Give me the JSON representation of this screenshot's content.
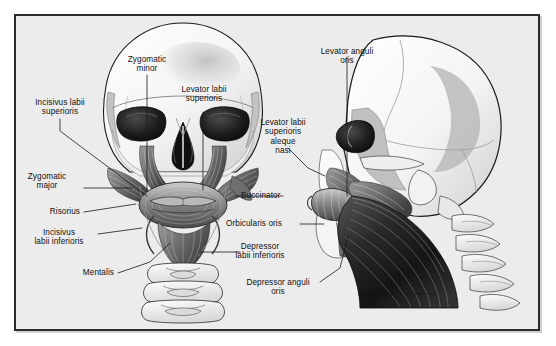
{
  "figure": {
    "background_color": "#ececec",
    "outer_color": "#ffffff",
    "frame_color": "#2b2b2b",
    "text_color": "#111111"
  },
  "views": {
    "anterior": {
      "name": "anterior-skull-view",
      "description": "Front view of skull with facial muscles and cervical vertebrae"
    },
    "lateral": {
      "name": "lateral-skull-view",
      "description": "Side view of skull with platysma and facial muscles"
    }
  },
  "labels": [
    {
      "id": "zygomatic-minor",
      "text": "Zygomatic\nminor",
      "align": "center"
    },
    {
      "id": "levator-labii-superioris",
      "text": "Levator labii\nsuperioris",
      "align": "center"
    },
    {
      "id": "incisivus-labii-superioris",
      "text": "Incisivus labii\nsuperioris",
      "align": "center"
    },
    {
      "id": "zygomatic-major",
      "text": "Zygomatic\nmajor",
      "align": "center"
    },
    {
      "id": "risorius",
      "text": "Risorius",
      "align": "right"
    },
    {
      "id": "incisivus-labii-inferioris",
      "text": "Incisivus\nlabii inferioris",
      "align": "center"
    },
    {
      "id": "mentalis",
      "text": "Mentalis",
      "align": "right"
    },
    {
      "id": "levator-anguli-oris",
      "text": "Levator anguli\noris",
      "align": "center"
    },
    {
      "id": "levator-labii-superioris-aleque-nasi",
      "text": "Levator labii\nsuperioris\naleque\nnasi",
      "align": "center"
    },
    {
      "id": "buccinator",
      "text": "Buccinator",
      "align": "left"
    },
    {
      "id": "orbicularis-oris",
      "text": "Orbicularis oris",
      "align": "left"
    },
    {
      "id": "depressor-labii-inferioris",
      "text": "Depressor\nlabii inferioris",
      "align": "center"
    },
    {
      "id": "depressor-anguli-oris",
      "text": "Depressor anguli\noris",
      "align": "center"
    },
    {
      "id": "platysma",
      "text": "Platysma",
      "align": "left"
    }
  ]
}
